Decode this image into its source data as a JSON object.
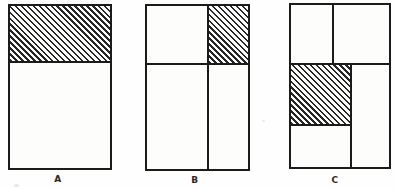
{
  "figure": {
    "type": "partitioned-rectangle fraction diagram",
    "panels": [
      {
        "label": "A",
        "regions": 2,
        "shaded_region": "top strip"
      },
      {
        "label": "B",
        "regions": 4,
        "shaded_region": "top-right cell"
      },
      {
        "label": "C",
        "regions": 5,
        "shaded_region": "middle-left cell"
      }
    ],
    "colors": {
      "background": "#fefefe",
      "line": "#1b1b1b",
      "hatch": "#262626",
      "paper": "#fdfdfc"
    },
    "hatch_style": "45deg backslash diagonal lines, ~4px period"
  }
}
